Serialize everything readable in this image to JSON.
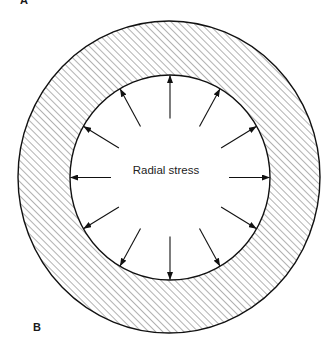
{
  "figure": {
    "panel_label_top": "A",
    "panel_label_bottom": "B",
    "center_label": "Radial stress"
  },
  "geometry": {
    "outer_ring": {
      "cx": 169,
      "cy": 177,
      "rx": 151,
      "ry": 156
    },
    "inner_circle": {
      "cx": 170,
      "cy": 177.5,
      "rx": 100,
      "ry": 102.5
    },
    "arrow_count": 12,
    "arrow_angle_step_deg": 30,
    "arrow_tail_radius": 59,
    "hatch_spacing": 5
  },
  "colors": {
    "stroke": "#111111",
    "hatch": "#555555",
    "background": "#ffffff"
  }
}
